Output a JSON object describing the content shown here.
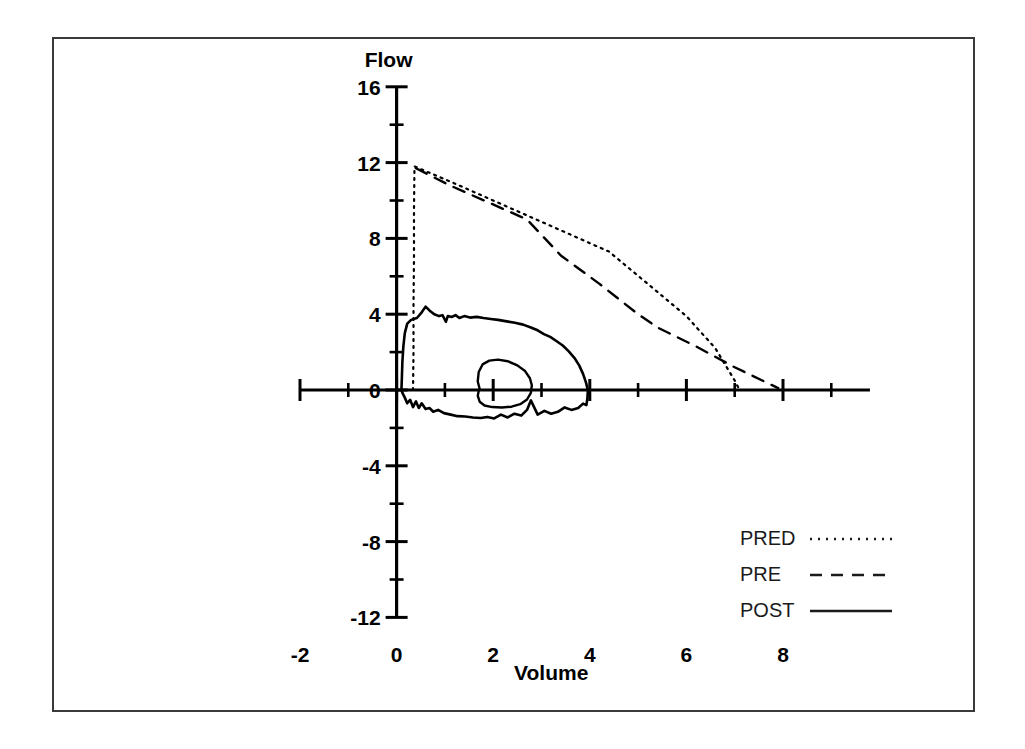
{
  "figure": {
    "frame": {
      "x": 52,
      "y": 37,
      "width": 923,
      "height": 675
    }
  },
  "chart_data": {
    "type": "line",
    "title": "",
    "xlabel": "Volume",
    "ylabel": "Flow",
    "xlim": [
      -2,
      9.8
    ],
    "ylim": [
      -12,
      16
    ],
    "grid": false,
    "legend_position": "bottom-right",
    "x_ticks": [
      -2,
      0,
      2,
      4,
      6,
      8
    ],
    "x_tick_labels": [
      "-2",
      "0",
      "2",
      "4",
      "6",
      "8"
    ],
    "x_minor_step": 1,
    "y_ticks": [
      16,
      12,
      8,
      4,
      0,
      -4,
      -8,
      -12
    ],
    "y_tick_labels": [
      "16",
      "12",
      "8",
      "4",
      "0",
      "-4",
      "-8",
      "-12"
    ],
    "y_minor_step": 2,
    "series": [
      {
        "name": "PRED",
        "style": "dotted",
        "description": "Predicted normal flow-volume envelope: near-vertical rise at volume 0.35 to peak flow 11.8, then straight decline to zero flow at volume 7.0",
        "points": [
          [
            0.34,
            0.0
          ],
          [
            0.35,
            2.0
          ],
          [
            0.35,
            4.5
          ],
          [
            0.36,
            7.0
          ],
          [
            0.36,
            9.5
          ],
          [
            0.37,
            11.8
          ],
          [
            1.2,
            10.9
          ],
          [
            2.0,
            10.0
          ],
          [
            2.8,
            9.1
          ],
          [
            3.6,
            8.2
          ],
          [
            4.4,
            7.3
          ],
          [
            5.2,
            5.6
          ],
          [
            6.0,
            3.9
          ],
          [
            6.6,
            2.2
          ],
          [
            7.0,
            0.5
          ],
          [
            7.1,
            0.0
          ]
        ]
      },
      {
        "name": "PRE",
        "style": "dashed",
        "description": "Pre-bronchodilator effort: rise at volume 0.4 to peak flow 11.7, declining to zero flow near volume 8.0",
        "points": [
          [
            0.4,
            11.7
          ],
          [
            1.1,
            10.8
          ],
          [
            1.9,
            9.9
          ],
          [
            2.7,
            9.0
          ],
          [
            3.4,
            7.1
          ],
          [
            4.2,
            5.6
          ],
          [
            5.0,
            4.0
          ],
          [
            5.4,
            3.3
          ],
          [
            6.2,
            2.3
          ],
          [
            7.0,
            1.2
          ],
          [
            7.9,
            0.1
          ]
        ]
      },
      {
        "name": "POST",
        "style": "solid",
        "description": "Post-bronchodilator flow-volume loop: expiratory limb peaks at flow 4.4 near volume 0.6 with a concave plateau to volume 4.0, inspiratory limb noisy between flow -0.6 and -1.6, plus a small inner tidal-breathing loop",
        "peak_expiratory_flow": 4.4,
        "peak_expiratory_volume": 0.6,
        "end_volume": 4.0,
        "peak_inspiratory_flow": -1.6,
        "expiratory_points": [
          [
            0.1,
            0.0
          ],
          [
            0.11,
            0.7
          ],
          [
            0.12,
            1.5
          ],
          [
            0.14,
            2.3
          ],
          [
            0.17,
            3.0
          ],
          [
            0.22,
            3.5
          ],
          [
            0.3,
            3.7
          ],
          [
            0.42,
            3.8
          ],
          [
            0.52,
            4.1
          ],
          [
            0.6,
            4.4
          ],
          [
            0.68,
            4.2
          ],
          [
            0.78,
            4.0
          ],
          [
            0.88,
            3.9
          ],
          [
            0.95,
            3.95
          ],
          [
            1.02,
            3.6
          ],
          [
            1.06,
            3.9
          ],
          [
            1.14,
            3.85
          ],
          [
            1.22,
            3.95
          ],
          [
            1.3,
            3.8
          ],
          [
            1.4,
            3.9
          ],
          [
            1.52,
            3.82
          ],
          [
            1.66,
            3.86
          ],
          [
            1.8,
            3.8
          ],
          [
            1.95,
            3.75
          ],
          [
            2.1,
            3.7
          ],
          [
            2.28,
            3.62
          ],
          [
            2.45,
            3.55
          ],
          [
            2.62,
            3.45
          ],
          [
            2.78,
            3.3
          ],
          [
            2.92,
            3.15
          ],
          [
            3.05,
            2.95
          ],
          [
            3.18,
            2.8
          ],
          [
            3.3,
            2.6
          ],
          [
            3.44,
            2.35
          ],
          [
            3.56,
            2.05
          ],
          [
            3.68,
            1.7
          ],
          [
            3.78,
            1.3
          ],
          [
            3.86,
            0.85
          ],
          [
            3.92,
            0.4
          ],
          [
            3.96,
            0.0
          ]
        ],
        "inspiratory_points": [
          [
            3.96,
            0.0
          ],
          [
            3.95,
            -0.45
          ],
          [
            3.93,
            -0.8
          ],
          [
            3.86,
            -0.72
          ],
          [
            3.76,
            -0.95
          ],
          [
            3.62,
            -1.05
          ],
          [
            3.48,
            -0.92
          ],
          [
            3.34,
            -1.15
          ],
          [
            3.2,
            -1.25
          ],
          [
            3.06,
            -1.1
          ],
          [
            2.92,
            -1.3
          ],
          [
            2.78,
            -0.55
          ],
          [
            2.7,
            -1.05
          ],
          [
            2.58,
            -1.35
          ],
          [
            2.44,
            -1.25
          ],
          [
            2.3,
            -1.45
          ],
          [
            2.16,
            -1.3
          ],
          [
            2.02,
            -1.5
          ],
          [
            1.88,
            -1.42
          ],
          [
            1.74,
            -1.48
          ],
          [
            1.58,
            -1.45
          ],
          [
            1.42,
            -1.4
          ],
          [
            1.26,
            -1.38
          ],
          [
            1.12,
            -1.3
          ],
          [
            0.98,
            -1.22
          ],
          [
            0.86,
            -1.05
          ],
          [
            0.76,
            -1.15
          ],
          [
            0.68,
            -0.95
          ],
          [
            0.6,
            -1.0
          ],
          [
            0.52,
            -0.7
          ],
          [
            0.46,
            -0.95
          ],
          [
            0.4,
            -0.6
          ],
          [
            0.34,
            -0.9
          ],
          [
            0.28,
            -0.52
          ],
          [
            0.22,
            -0.7
          ],
          [
            0.16,
            -0.35
          ],
          [
            0.12,
            -0.15
          ],
          [
            0.1,
            0.0
          ]
        ],
        "tidal_loop_points": [
          [
            1.72,
            0.05
          ],
          [
            1.68,
            0.45
          ],
          [
            1.7,
            0.95
          ],
          [
            1.78,
            1.35
          ],
          [
            1.92,
            1.55
          ],
          [
            2.1,
            1.6
          ],
          [
            2.3,
            1.52
          ],
          [
            2.5,
            1.3
          ],
          [
            2.66,
            1.0
          ],
          [
            2.76,
            0.62
          ],
          [
            2.8,
            0.25
          ],
          [
            2.78,
            -0.15
          ],
          [
            2.7,
            -0.5
          ],
          [
            2.56,
            -0.75
          ],
          [
            2.38,
            -0.88
          ],
          [
            2.18,
            -0.92
          ],
          [
            1.98,
            -0.9
          ],
          [
            1.82,
            -0.82
          ],
          [
            1.72,
            -0.62
          ],
          [
            1.68,
            -0.3
          ],
          [
            1.7,
            -0.05
          ],
          [
            1.72,
            0.05
          ]
        ]
      }
    ],
    "legend": [
      {
        "label": "PRED",
        "style": "dotted"
      },
      {
        "label": "PRE",
        "style": "dashed"
      },
      {
        "label": "POST",
        "style": "solid"
      }
    ]
  }
}
